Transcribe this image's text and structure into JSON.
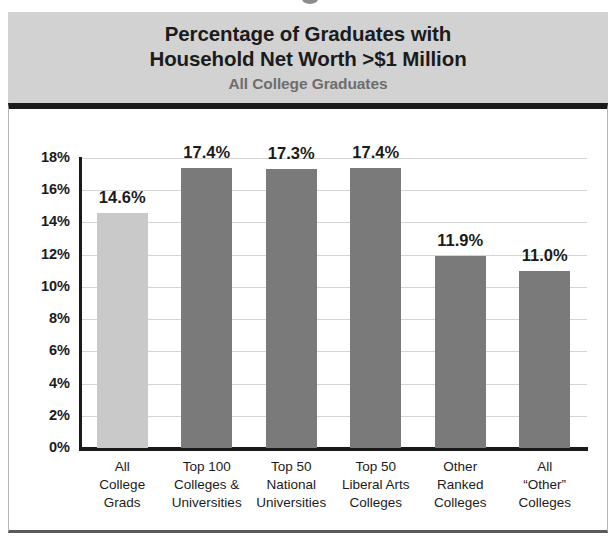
{
  "header": {
    "title_line1": "Percentage of Graduates with",
    "title_line2": "Household Net Worth >$1 Million",
    "subtitle": "All College Graduates"
  },
  "colors": {
    "header_band": "#d2d2d2",
    "title_text": "#1b1b1b",
    "subtitle_text": "#6e6e6e",
    "bar_highlight": "#c9c9c9",
    "bar_default": "#7a7a7a",
    "gridline": "#d4d4d4",
    "axis": "#1a1a1a"
  },
  "chart_data": {
    "type": "bar",
    "title": "Percentage of Graduates with Household Net Worth >$1 Million",
    "subtitle": "All College Graduates",
    "xlabel": "",
    "ylabel": "",
    "ylim": [
      0,
      18
    ],
    "ytick_labels": [
      "18%",
      "16%",
      "14%",
      "12%",
      "10%",
      "8%",
      "6%",
      "4%",
      "2%",
      "0%"
    ],
    "ytick_values": [
      18,
      16,
      14,
      12,
      10,
      8,
      6,
      4,
      2,
      0
    ],
    "grid": true,
    "legend": "none",
    "categories": [
      "All\nCollege\nGrads",
      "Top 100\nColleges &\nUniversities",
      "Top 50\nNational\nUniversities",
      "Top 50\nLiberal Arts\nColleges",
      "Other\nRanked\nColleges",
      "All\n“Other”\nColleges"
    ],
    "values": [
      14.6,
      17.4,
      17.3,
      17.4,
      11.9,
      11.0
    ],
    "value_labels": [
      "14.6%",
      "17.4%",
      "17.3%",
      "17.4%",
      "11.9%",
      "11.0%"
    ],
    "bar_colors": [
      "#c9c9c9",
      "#7a7a7a",
      "#7a7a7a",
      "#7a7a7a",
      "#7a7a7a",
      "#7a7a7a"
    ]
  }
}
